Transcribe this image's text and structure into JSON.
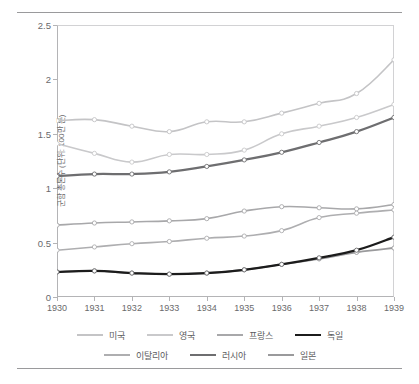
{
  "chart_data": {
    "type": "line",
    "title": "",
    "xlabel": "",
    "ylabel": "군함 총톤수 (단위: 100만 톤)",
    "x": [
      1930,
      1931,
      1932,
      1933,
      1934,
      1935,
      1936,
      1937,
      1938,
      1939
    ],
    "xticklabels": [
      "1930",
      "1931",
      "1932",
      "1933",
      "1934",
      "1935",
      "1936",
      "1937",
      "1938",
      "1939"
    ],
    "yticklabels": [
      "0",
      "0.5",
      "1",
      "1.5",
      "2",
      "2.5"
    ],
    "ytickvalues": [
      0,
      0.5,
      1,
      1.5,
      2,
      2.5
    ],
    "ylim": [
      0,
      2.5
    ],
    "xlim": [
      1930,
      1939
    ],
    "grid": false,
    "legend_position": "bottom",
    "markers": "open-circle",
    "series": [
      {
        "name": "미국",
        "color": "#c4c4c6",
        "width": 1.6,
        "values": [
          1.62,
          1.63,
          1.57,
          1.52,
          1.61,
          1.61,
          1.69,
          1.78,
          1.87,
          2.18
        ]
      },
      {
        "name": "영국",
        "color": "#c9c9cb",
        "width": 1.6,
        "values": [
          1.41,
          1.32,
          1.24,
          1.31,
          1.31,
          1.35,
          1.5,
          1.57,
          1.65,
          1.77
        ]
      },
      {
        "name": "프랑스",
        "color": "#a8a8aa",
        "width": 1.6,
        "values": [
          0.66,
          0.68,
          0.69,
          0.7,
          0.72,
          0.79,
          0.83,
          0.82,
          0.81,
          0.85
        ]
      },
      {
        "name": "독일",
        "color": "#1c1c1c",
        "width": 2.3,
        "values": [
          0.23,
          0.24,
          0.22,
          0.21,
          0.22,
          0.25,
          0.3,
          0.36,
          0.43,
          0.55
        ]
      },
      {
        "name": "이탈리아",
        "color": "#aeaeb0",
        "width": 1.6,
        "values": [
          0.43,
          0.46,
          0.49,
          0.51,
          0.54,
          0.56,
          0.61,
          0.73,
          0.77,
          0.8
        ]
      },
      {
        "name": "러시아",
        "color": "#6e6e70",
        "width": 2.3,
        "values": [
          1.11,
          1.13,
          1.13,
          1.15,
          1.2,
          1.26,
          1.33,
          1.42,
          1.52,
          1.65
        ]
      },
      {
        "name": "일본",
        "color": "#9a9a9c",
        "width": 1.9,
        "values": [
          0.23,
          0.24,
          0.22,
          0.21,
          0.22,
          0.25,
          0.3,
          0.35,
          0.41,
          0.45
        ]
      }
    ]
  },
  "legend": {
    "rows": [
      [
        "미국",
        "영국",
        "프랑스",
        "독일"
      ],
      [
        "이탈리아",
        "러시아",
        "일본"
      ]
    ]
  },
  "caption": {
    "text": ""
  }
}
